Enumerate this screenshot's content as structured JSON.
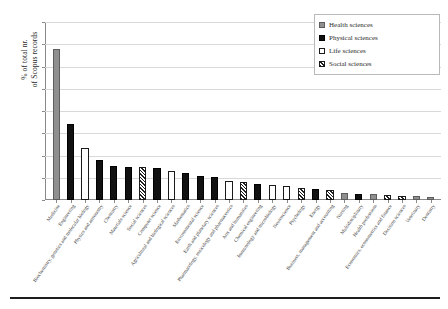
{
  "axes": {
    "ylabel_line1": "% of total nr.",
    "ylabel_line2": "of Scopus records",
    "yticks": [
      "0%",
      "5%",
      "10%",
      "15%",
      "20%",
      "25%",
      "30%",
      "35%",
      "40%"
    ]
  },
  "legend": {
    "items": [
      {
        "label": "Health sciences",
        "swatch": "health",
        "color": "#8f8f8f"
      },
      {
        "label": "Physical sciences",
        "swatch": "physical",
        "color": "#111111"
      },
      {
        "label": "Life sciences",
        "swatch": "life",
        "color": "#ffffff"
      },
      {
        "label": "Social sciences",
        "swatch": "social",
        "color": "#1f1f1f"
      }
    ]
  },
  "chart_data": {
    "type": "bar",
    "title": "",
    "xlabel": "",
    "ylabel": "% of total nr. of Scopus records",
    "ylim": [
      0,
      40
    ],
    "ytick_step": 5,
    "ytick_format": "percent",
    "grid": true,
    "legend_position": "top-right",
    "categories": [
      "Medicine",
      "Engineering",
      "Biochemistry, genetics and molecular biology",
      "Physics and astronomy",
      "Chemistry",
      "Materials science",
      "Social sciences",
      "Computer science",
      "Agricultural and biological sciences",
      "Mathematics",
      "Environmental science",
      "Earth and planetary sciences",
      "Pharmacology, toxicology and pharmaceutics",
      "Arts and humanities",
      "Chemical engineering",
      "Immunology and microbiology",
      "Neuroscience",
      "Psychology",
      "Energy",
      "Business, management and accounting",
      "Nursing",
      "Multidisciplinary",
      "Health professions",
      "Economics, econometrics and finance",
      "Decision sciences",
      "Veterinary",
      "Dentistry"
    ],
    "groups": [
      "health",
      "physical",
      "life",
      "physical",
      "physical",
      "physical",
      "social",
      "physical",
      "life",
      "physical",
      "physical",
      "physical",
      "life",
      "social",
      "physical",
      "life",
      "life",
      "social",
      "physical",
      "social",
      "health",
      "physical",
      "health",
      "social",
      "social",
      "health",
      "health"
    ],
    "values": [
      34.0,
      17.0,
      11.7,
      9.0,
      7.6,
      7.5,
      7.4,
      7.2,
      6.6,
      6.0,
      5.3,
      5.1,
      4.2,
      4.1,
      3.6,
      3.4,
      3.2,
      2.6,
      2.4,
      2.2,
      1.5,
      1.4,
      1.3,
      1.2,
      1.0,
      0.8,
      0.7
    ]
  }
}
